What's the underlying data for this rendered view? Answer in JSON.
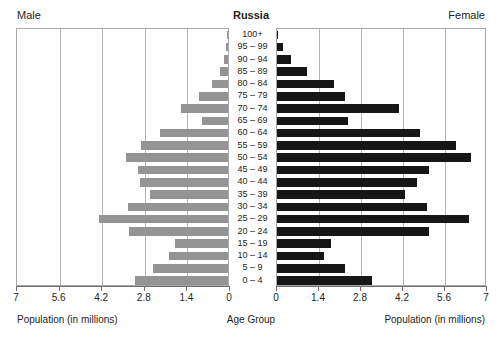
{
  "header": {
    "male_label": "Male",
    "title": "Russia",
    "female_label": "Female"
  },
  "captions": {
    "left": "Population (in millions)",
    "center": "Age Group",
    "right": "Population (in millions)"
  },
  "colors": {
    "male_bar": "#949494",
    "female_bar": "#161616",
    "grid": "#b5b5b5",
    "frame": "#a8a8a8",
    "text": "#231f20"
  },
  "axis": {
    "left_ticks": [
      "7",
      "5.6",
      "4.2",
      "2.8",
      "1.4",
      "0"
    ],
    "right_ticks": [
      "0",
      "1.4",
      "2.8",
      "4.2",
      "5.6",
      "7"
    ],
    "max": 7,
    "tick_step": 1.4
  },
  "chart_data": {
    "type": "bar",
    "subtype": "population-pyramid",
    "title": "Russia",
    "xlabel": "Population (in millions)",
    "ylabel": "Age Group",
    "xlim": [
      0,
      7
    ],
    "xticks": [
      0,
      1.4,
      2.8,
      4.2,
      5.6,
      7
    ],
    "grid": true,
    "legend": [
      "Male",
      "Female"
    ],
    "legend_position": "top-left-and-top-right",
    "categories": [
      "100+",
      "95 – 99",
      "90 – 94",
      "85 – 89",
      "80 – 84",
      "75 – 79",
      "70 – 74",
      "65 – 69",
      "60 – 64",
      "55 – 59",
      "50 – 54",
      "45 – 49",
      "40 – 44",
      "35 – 39",
      "30 – 34",
      "25 – 29",
      "20 – 24",
      "15 – 19",
      "10 – 14",
      "5 – 9",
      "0 – 4"
    ],
    "series": [
      {
        "name": "Male",
        "direction": "left",
        "values": [
          0.02,
          0.06,
          0.12,
          0.25,
          0.52,
          0.95,
          1.55,
          0.85,
          2.25,
          2.85,
          3.35,
          2.95,
          2.9,
          2.55,
          3.3,
          4.25,
          3.25,
          1.75,
          1.95,
          2.45,
          3.05
        ]
      },
      {
        "name": "Female",
        "direction": "right",
        "values": [
          0.03,
          0.2,
          0.45,
          1.0,
          1.9,
          2.25,
          4.05,
          2.35,
          4.75,
          5.95,
          6.45,
          5.05,
          4.65,
          4.25,
          5.0,
          6.4,
          5.05,
          1.8,
          1.55,
          2.25,
          3.15
        ]
      }
    ]
  }
}
